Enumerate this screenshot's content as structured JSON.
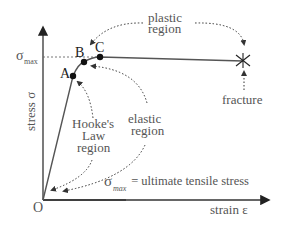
{
  "diagram": {
    "axes": {
      "y_label": "stress σ",
      "x_label": "strain ε",
      "origin_label": "O",
      "sigma_max_label": "σ",
      "sigma_max_sub": "max"
    },
    "points": [
      {
        "id": "A",
        "label": "A"
      },
      {
        "id": "B",
        "label": "B"
      },
      {
        "id": "C",
        "label": "C"
      }
    ],
    "annotations": {
      "plastic_line1": "plastic",
      "plastic_line2": "region",
      "fracture": "fracture",
      "hooke_line1": "Hooke's",
      "hooke_line2": "Law",
      "hooke_line3": "region",
      "elastic_line1": "elastic",
      "elastic_line2": "region",
      "legend_sigma": "σ",
      "legend_sub": "max",
      "legend_rest": " = ultimate tensile stress"
    },
    "colors": {
      "axis": "#333333",
      "curve": "#555555",
      "text": "#555555",
      "points": "#111111"
    }
  }
}
